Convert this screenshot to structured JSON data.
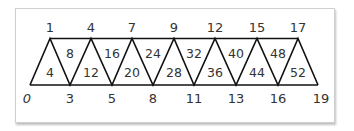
{
  "diagram": {
    "title": "",
    "top_labels": [
      "1",
      "4",
      "7",
      "9",
      "12",
      "15",
      "17"
    ],
    "bottom_labels": [
      "0",
      "3",
      "5",
      "8",
      "11",
      "13",
      "16",
      "19"
    ],
    "upward_triangle_labels": [
      "4",
      "12",
      "20",
      "28",
      "36",
      "44",
      "52"
    ],
    "downward_triangle_labels": [
      "8",
      "16",
      "24",
      "32",
      "40",
      "48"
    ],
    "colors": {
      "line": "#111111",
      "text": "#333333",
      "border": "#cfcfcf"
    }
  }
}
